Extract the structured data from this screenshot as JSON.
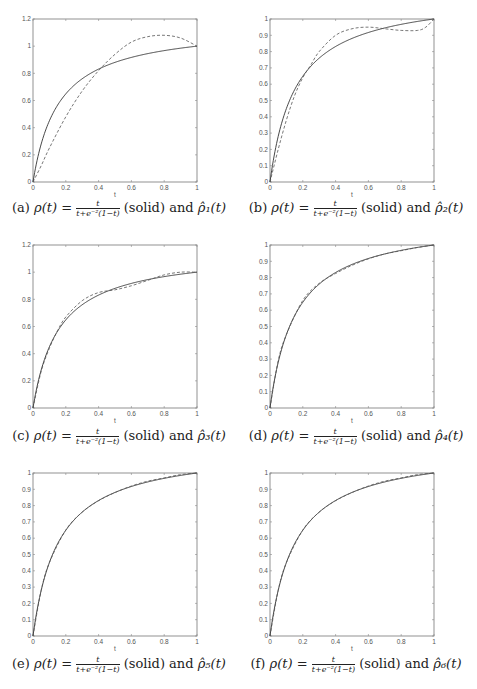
{
  "figure": {
    "panels": [
      {
        "id": "a",
        "label": "(a)",
        "caption_prefix": "ρ(t) =",
        "frac_num": "t",
        "frac_den": "t+e⁻²(1−t)",
        "caption_suffix": "(solid) and",
        "approx_name": "ρ̂₁(t)"
      },
      {
        "id": "b",
        "label": "(b)",
        "caption_prefix": "ρ(t) =",
        "frac_num": "t",
        "frac_den": "t+e⁻²(1−t)",
        "caption_suffix": "(solid) and",
        "approx_name": "ρ̂₂(t)"
      },
      {
        "id": "c",
        "label": "(c)",
        "caption_prefix": "ρ(t) =",
        "frac_num": "t",
        "frac_den": "t+e⁻²(1−t)",
        "caption_suffix": "(solid) and",
        "approx_name": "ρ̂₃(t)"
      },
      {
        "id": "d",
        "label": "(d)",
        "caption_prefix": "ρ(t) =",
        "frac_num": "t",
        "frac_den": "t+e⁻²(1−t)",
        "caption_suffix": "(solid) and",
        "approx_name": "ρ̂₄(t)"
      },
      {
        "id": "e",
        "label": "(e)",
        "caption_prefix": "ρ(t) =",
        "frac_num": "t",
        "frac_den": "t+e⁻²(1−t)",
        "caption_suffix": "(solid) and",
        "approx_name": "ρ̂₅(t)"
      },
      {
        "id": "f",
        "label": "(f)",
        "caption_prefix": "ρ(t) =",
        "frac_num": "t",
        "frac_den": "t+e⁻²(1−t)",
        "caption_suffix": "(solid) and",
        "approx_name": "ρ̂₆(t)"
      }
    ]
  },
  "chart_data": [
    {
      "type": "line",
      "title": "(a) ρ(t) = t/(t+e^-2(1-t)) (solid) and ρ̂1(t)",
      "xlabel": "t",
      "ylabel": "",
      "xlim": [
        0,
        1
      ],
      "ylim": [
        0,
        1.2
      ],
      "xticks": [
        "0",
        "0.2",
        "0.4",
        "0.6",
        "0.8",
        "1"
      ],
      "yticks": [
        "0",
        "0.2",
        "0.4",
        "0.6",
        "0.8",
        "1",
        "1.2"
      ],
      "grid": false,
      "series": [
        {
          "name": "ρ(t) (solid)",
          "style": "solid",
          "formula": "t/(t+exp(-2)*(1-t))",
          "x": [
            0,
            0.05,
            0.1,
            0.2,
            0.3,
            0.4,
            0.5,
            0.6,
            0.7,
            0.8,
            0.9,
            1.0
          ],
          "y": [
            0,
            0.28,
            0.45,
            0.65,
            0.76,
            0.83,
            0.88,
            0.92,
            0.95,
            0.97,
            0.99,
            1.0
          ]
        },
        {
          "name": "ρ̂1(t) (dashed)",
          "style": "dashed",
          "x": [
            0,
            0.05,
            0.1,
            0.2,
            0.3,
            0.4,
            0.5,
            0.6,
            0.7,
            0.8,
            0.9,
            1.0
          ],
          "y": [
            0,
            0.12,
            0.25,
            0.48,
            0.67,
            0.82,
            0.94,
            1.03,
            1.07,
            1.08,
            1.06,
            1.0
          ]
        }
      ]
    },
    {
      "type": "line",
      "title": "(b) ρ(t) = t/(t+e^-2(1-t)) (solid) and ρ̂2(t)",
      "xlabel": "t",
      "ylabel": "",
      "xlim": [
        0,
        1
      ],
      "ylim": [
        0,
        1
      ],
      "xticks": [
        "0",
        "0.2",
        "0.4",
        "0.6",
        "0.8",
        "1"
      ],
      "yticks": [
        "0",
        "0.1",
        "0.2",
        "0.3",
        "0.4",
        "0.5",
        "0.6",
        "0.7",
        "0.8",
        "0.9",
        "1"
      ],
      "grid": false,
      "series": [
        {
          "name": "ρ(t) (solid)",
          "style": "solid",
          "formula": "t/(t+exp(-2)*(1-t))",
          "x": [
            0,
            0.05,
            0.1,
            0.2,
            0.3,
            0.4,
            0.5,
            0.6,
            0.7,
            0.8,
            0.9,
            1.0
          ],
          "y": [
            0,
            0.28,
            0.45,
            0.65,
            0.76,
            0.83,
            0.88,
            0.92,
            0.95,
            0.97,
            0.99,
            1.0
          ]
        },
        {
          "name": "ρ̂2(t) (dashed)",
          "style": "dashed",
          "x": [
            0,
            0.05,
            0.1,
            0.15,
            0.2,
            0.25,
            0.3,
            0.4,
            0.5,
            0.6,
            0.7,
            0.8,
            0.9,
            0.95,
            1.0
          ],
          "y": [
            0,
            0.2,
            0.38,
            0.53,
            0.64,
            0.72,
            0.8,
            0.9,
            0.94,
            0.95,
            0.94,
            0.93,
            0.93,
            0.95,
            1.0
          ]
        }
      ]
    },
    {
      "type": "line",
      "title": "(c) ρ(t) = t/(t+e^-2(1-t)) (solid) and ρ̂3(t)",
      "xlabel": "t",
      "ylabel": "",
      "xlim": [
        0,
        1
      ],
      "ylim": [
        0,
        1.2
      ],
      "xticks": [
        "0",
        "0.2",
        "0.4",
        "0.6",
        "0.8",
        "1"
      ],
      "yticks": [
        "0",
        "0.2",
        "0.4",
        "0.6",
        "0.8",
        "1",
        "1.2"
      ],
      "grid": false,
      "series": [
        {
          "name": "ρ(t) (solid)",
          "style": "solid",
          "formula": "t/(t+exp(-2)*(1-t))",
          "x": [
            0,
            0.05,
            0.1,
            0.2,
            0.3,
            0.4,
            0.5,
            0.6,
            0.7,
            0.8,
            0.9,
            1.0
          ],
          "y": [
            0,
            0.28,
            0.45,
            0.65,
            0.76,
            0.83,
            0.88,
            0.92,
            0.95,
            0.97,
            0.99,
            1.0
          ]
        },
        {
          "name": "ρ̂3(t) (dashed)",
          "style": "dashed",
          "x": [
            0,
            0.05,
            0.1,
            0.15,
            0.2,
            0.3,
            0.4,
            0.5,
            0.6,
            0.7,
            0.8,
            0.9,
            1.0
          ],
          "y": [
            0,
            0.27,
            0.44,
            0.57,
            0.67,
            0.79,
            0.85,
            0.87,
            0.9,
            0.94,
            0.98,
            1.0,
            1.0
          ]
        }
      ]
    },
    {
      "type": "line",
      "title": "(d) ρ(t) = t/(t+e^-2(1-t)) (solid) and ρ̂4(t)",
      "xlabel": "t",
      "ylabel": "",
      "xlim": [
        0,
        1
      ],
      "ylim": [
        0,
        1
      ],
      "xticks": [
        "0",
        "0.2",
        "0.4",
        "0.6",
        "0.8",
        "1"
      ],
      "yticks": [
        "0",
        "0.1",
        "0.2",
        "0.3",
        "0.4",
        "0.5",
        "0.6",
        "0.7",
        "0.8",
        "0.9",
        "1"
      ],
      "grid": false,
      "series": [
        {
          "name": "ρ(t) (solid)",
          "style": "solid",
          "formula": "t/(t+exp(-2)*(1-t))",
          "x": [
            0,
            0.05,
            0.1,
            0.2,
            0.3,
            0.4,
            0.5,
            0.6,
            0.7,
            0.8,
            0.9,
            1.0
          ],
          "y": [
            0,
            0.28,
            0.45,
            0.65,
            0.76,
            0.83,
            0.88,
            0.92,
            0.95,
            0.97,
            0.99,
            1.0
          ]
        },
        {
          "name": "ρ̂4(t) (dashed)",
          "style": "dashed",
          "x": [
            0,
            0.05,
            0.1,
            0.2,
            0.3,
            0.4,
            0.5,
            0.6,
            0.7,
            0.8,
            0.9,
            1.0
          ],
          "y": [
            0,
            0.29,
            0.45,
            0.66,
            0.765,
            0.825,
            0.875,
            0.915,
            0.945,
            0.965,
            0.985,
            1.0
          ]
        }
      ]
    },
    {
      "type": "line",
      "title": "(e) ρ(t) = t/(t+e^-2(1-t)) (solid) and ρ̂5(t)",
      "xlabel": "t",
      "ylabel": "",
      "xlim": [
        0,
        1
      ],
      "ylim": [
        0,
        1
      ],
      "xticks": [
        "0",
        "0.2",
        "0.4",
        "0.6",
        "0.8",
        "1"
      ],
      "yticks": [
        "0",
        "0.1",
        "0.2",
        "0.3",
        "0.4",
        "0.5",
        "0.6",
        "0.7",
        "0.8",
        "0.9",
        "1"
      ],
      "grid": false,
      "series": [
        {
          "name": "ρ(t) (solid)",
          "style": "solid",
          "formula": "t/(t+exp(-2)*(1-t))",
          "x": [
            0,
            0.05,
            0.1,
            0.2,
            0.3,
            0.4,
            0.5,
            0.6,
            0.7,
            0.8,
            0.9,
            1.0
          ],
          "y": [
            0,
            0.28,
            0.45,
            0.65,
            0.76,
            0.83,
            0.88,
            0.92,
            0.95,
            0.97,
            0.99,
            1.0
          ]
        },
        {
          "name": "ρ̂5(t) (dashed)",
          "style": "dashed",
          "x": [
            0,
            0.05,
            0.1,
            0.2,
            0.3,
            0.4,
            0.5,
            0.6,
            0.7,
            0.8,
            0.9,
            1.0
          ],
          "y": [
            0,
            0.28,
            0.45,
            0.65,
            0.76,
            0.83,
            0.88,
            0.92,
            0.95,
            0.97,
            0.99,
            1.0
          ]
        }
      ]
    },
    {
      "type": "line",
      "title": "(f) ρ(t) = t/(t+e^-2(1-t)) (solid) and ρ̂6(t)",
      "xlabel": "t",
      "ylabel": "",
      "xlim": [
        0,
        1
      ],
      "ylim": [
        0,
        1
      ],
      "xticks": [
        "0",
        "0.2",
        "0.4",
        "0.6",
        "0.8",
        "1"
      ],
      "yticks": [
        "0",
        "0.1",
        "0.2",
        "0.3",
        "0.4",
        "0.5",
        "0.6",
        "0.7",
        "0.8",
        "0.9",
        "1"
      ],
      "grid": false,
      "series": [
        {
          "name": "ρ(t) (solid)",
          "style": "solid",
          "formula": "t/(t+exp(-2)*(1-t))",
          "x": [
            0,
            0.05,
            0.1,
            0.2,
            0.3,
            0.4,
            0.5,
            0.6,
            0.7,
            0.8,
            0.9,
            1.0
          ],
          "y": [
            0,
            0.28,
            0.45,
            0.65,
            0.76,
            0.83,
            0.88,
            0.92,
            0.95,
            0.97,
            0.99,
            1.0
          ]
        },
        {
          "name": "ρ̂6(t) (dashed)",
          "style": "dashed",
          "x": [
            0,
            0.05,
            0.1,
            0.2,
            0.3,
            0.4,
            0.5,
            0.6,
            0.7,
            0.8,
            0.9,
            1.0
          ],
          "y": [
            0,
            0.28,
            0.45,
            0.65,
            0.76,
            0.83,
            0.88,
            0.92,
            0.95,
            0.97,
            0.99,
            1.0
          ]
        }
      ]
    }
  ]
}
